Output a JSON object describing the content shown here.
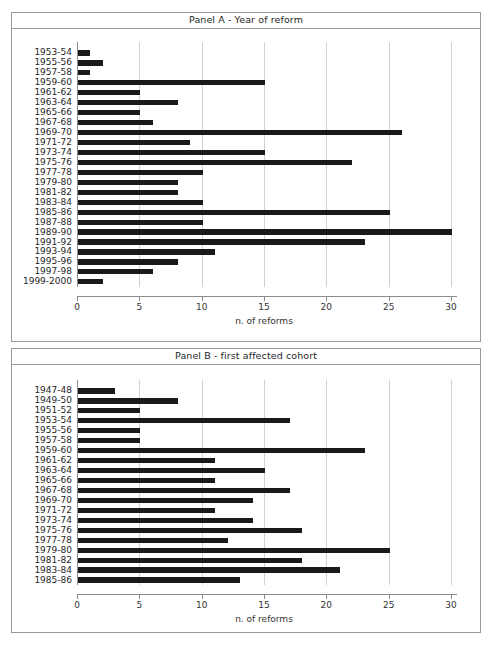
{
  "figure": {
    "background": "#ffffff",
    "bar_color": "#1a1a1a",
    "grid_color": "#d2d2d2",
    "axis_color": "#8c8c8c",
    "frame_color": "#9a9a9a"
  },
  "panels": [
    {
      "id": "panel-a",
      "title": "Panel A - Year of reform",
      "xlabel": "n. of reforms"
    },
    {
      "id": "panel-b",
      "title": "Panel B - first affected cohort",
      "xlabel": "n. of reforms"
    }
  ],
  "axis": {
    "ticks": [
      "0",
      "5",
      "10",
      "15",
      "20",
      "25",
      "30"
    ],
    "xlim": [
      0,
      30
    ]
  },
  "chart_data": [
    {
      "type": "bar",
      "orientation": "horizontal",
      "title": "Panel A - Year of reform",
      "xlabel": "n. of reforms",
      "ylabel": "",
      "xlim": [
        0,
        30
      ],
      "xticks": [
        0,
        5,
        10,
        15,
        20,
        25,
        30
      ],
      "grid": true,
      "legend": false,
      "categories": [
        "1953-54",
        "1955-56",
        "1957-58",
        "1959-60",
        "1961-62",
        "1963-64",
        "1965-66",
        "1967-68",
        "1969-70",
        "1971-72",
        "1973-74",
        "1975-76",
        "1977-78",
        "1979-80",
        "1981-82",
        "1983-84",
        "1985-86",
        "1987-88",
        "1989-90",
        "1991-92",
        "1993-94",
        "1995-96",
        "1997-98",
        "1999-2000"
      ],
      "values": [
        1,
        2,
        1,
        15,
        5,
        8,
        5,
        6,
        26,
        9,
        15,
        22,
        10,
        8,
        8,
        10,
        25,
        10,
        30,
        23,
        11,
        8,
        6,
        2
      ]
    },
    {
      "type": "bar",
      "orientation": "horizontal",
      "title": "Panel B - first affected cohort",
      "xlabel": "n. of reforms",
      "ylabel": "",
      "xlim": [
        0,
        30
      ],
      "xticks": [
        0,
        5,
        10,
        15,
        20,
        25,
        30
      ],
      "grid": true,
      "legend": false,
      "categories": [
        "1947-48",
        "1949-50",
        "1951-52",
        "1953-54",
        "1955-56",
        "1957-58",
        "1959-60",
        "1961-62",
        "1963-64",
        "1965-66",
        "1967-68",
        "1969-70",
        "1971-72",
        "1973-74",
        "1975-76",
        "1977-78",
        "1979-80",
        "1981-82",
        "1983-84",
        "1985-86"
      ],
      "values": [
        3,
        8,
        5,
        17,
        5,
        5,
        23,
        11,
        15,
        11,
        17,
        14,
        11,
        14,
        18,
        12,
        25,
        18,
        21,
        13
      ]
    }
  ]
}
